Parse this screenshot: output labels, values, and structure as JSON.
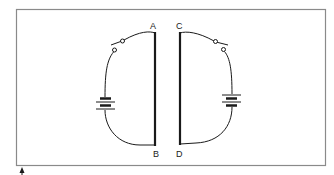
{
  "diagram": {
    "type": "circuit",
    "labels": {
      "A": "A",
      "B": "B",
      "C": "C",
      "D": "D"
    },
    "components": {
      "left_circuit": {
        "plate": "AB",
        "battery": "battery",
        "switch": "open-switch"
      },
      "right_circuit": {
        "plate": "CD",
        "battery": "battery",
        "switch": "open-switch"
      }
    },
    "marker": "arrow-up-marker",
    "colors": {
      "line": "#1a1a1a",
      "frame": "#8a8a8a",
      "background": "#ffffff"
    }
  }
}
